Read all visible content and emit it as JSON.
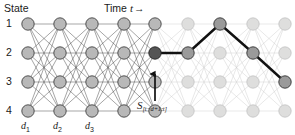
{
  "figure": {
    "axis_labels": {
      "state": "State",
      "time": "Time",
      "time_var": "t",
      "time_arrow": "→"
    },
    "state_rows": [
      "1",
      "2",
      "3",
      "4"
    ],
    "depth_labels": [
      {
        "base": "d",
        "sub": "1"
      },
      {
        "base": "d",
        "sub": "2"
      },
      {
        "base": "d",
        "sub": "3"
      }
    ],
    "window_annotation": {
      "base": "S",
      "sub": "[t−d+1:t]",
      "arrow": "up-arrow"
    }
  },
  "chart_data": {
    "type": "diagram",
    "xlabel": "Time t →",
    "ylabel": "State",
    "n_columns": 9,
    "n_rows": 4,
    "column_x": [
      28,
      60,
      92,
      124,
      155,
      188,
      220,
      253,
      285
    ],
    "row_y": [
      24,
      53,
      82,
      111
    ],
    "node_radius": 6.2,
    "left_section_columns": [
      1,
      2,
      3,
      4,
      5
    ],
    "right_section_columns": [
      5,
      6,
      7,
      8,
      9
    ],
    "current_node": {
      "col": 5,
      "row": 2
    },
    "path": [
      {
        "col": 5,
        "row": 2
      },
      {
        "col": 6,
        "row": 2
      },
      {
        "col": 7,
        "row": 1
      },
      {
        "col": 8,
        "row": 2
      },
      {
        "col": 9,
        "row": 3
      }
    ],
    "legend_position": "none",
    "grid": false
  },
  "colors": {
    "background": "#ffffff",
    "node_fill_dark": "#b8b8b8",
    "node_fill_light": "#dededd",
    "node_stroke_dark": "#3a3a3a",
    "node_stroke_light": "#bdbdbd",
    "node_active": "#555555",
    "node_path": "#9a9a9a",
    "edge_dark": "#4a4a4a",
    "edge_light": "#cfcfcf",
    "path_stroke": "#111111",
    "text": "#1a1a1a"
  }
}
